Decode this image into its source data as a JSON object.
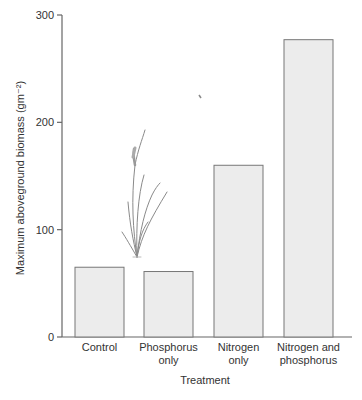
{
  "chart_data": {
    "type": "bar",
    "title": "",
    "xlabel": "Treatment",
    "ylabel": "Maximum aboveground biomass (gm⁻²)",
    "ylim": [
      0,
      300
    ],
    "yticks": [
      0,
      100,
      200,
      300
    ],
    "grid": false,
    "legend": null,
    "categories": [
      "Control",
      "Phosphorus only",
      "Nitrogen only",
      "Nitrogen and phosphorus"
    ],
    "category_lines": [
      [
        "Control"
      ],
      [
        "Phosphorus",
        "only"
      ],
      [
        "Nitrogen",
        "only"
      ],
      [
        "Nitrogen and",
        "phosphorus"
      ]
    ],
    "values": [
      65,
      61,
      160,
      277
    ],
    "annotations": [
      "grass plant illustration above Control/Phosphorus bars"
    ]
  },
  "colors": {
    "bar_fill": "#ececec",
    "bar_stroke": "#777777",
    "axis": "#666666",
    "text": "#333333",
    "plant": "#888888"
  }
}
